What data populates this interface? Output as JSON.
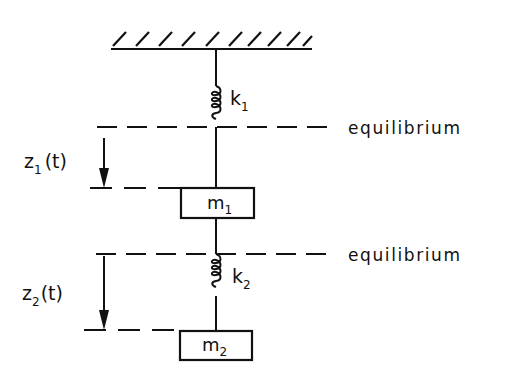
{
  "diagram": {
    "ceiling": {
      "label": "fixed support"
    },
    "springs": [
      {
        "name": "k",
        "subscript": "1"
      },
      {
        "name": "k",
        "subscript": "2"
      }
    ],
    "masses": [
      {
        "name": "m",
        "subscript": "1"
      },
      {
        "name": "m",
        "subscript": "2"
      }
    ],
    "equilibrium_labels": [
      "equilibrium",
      "equilibrium"
    ],
    "displacements": [
      {
        "name": "z",
        "subscript": "1",
        "arg": "(t)"
      },
      {
        "name": "z",
        "subscript": "2",
        "arg": "(t)"
      }
    ],
    "colors": {
      "ink": "#111111",
      "background": "#ffffff"
    }
  }
}
